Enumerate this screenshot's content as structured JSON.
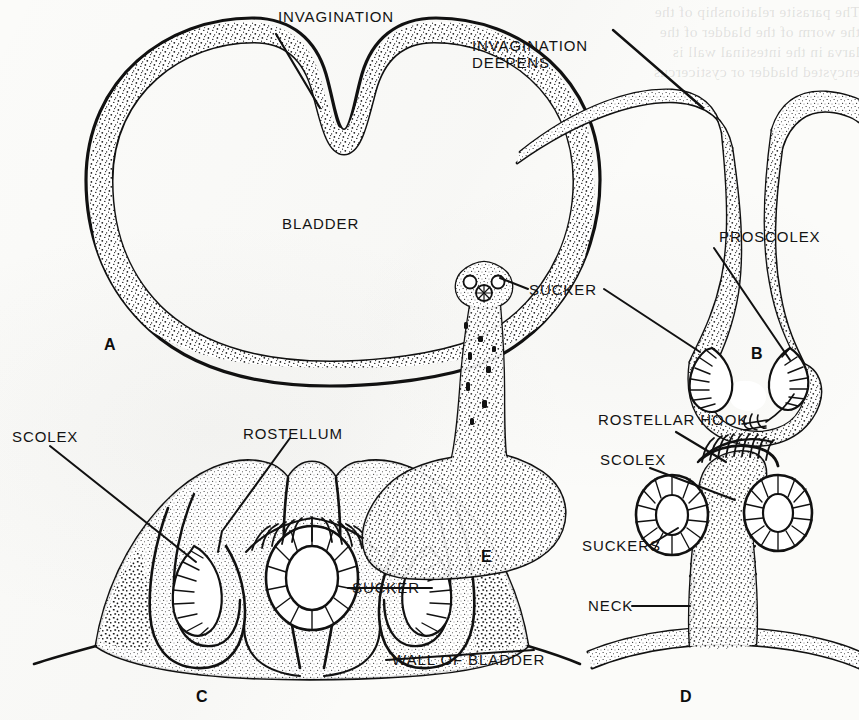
{
  "figure": {
    "background_color": "#fbfbf9",
    "ink_color": "#111111",
    "ghost_text": "The parasite relationship of the\nthe worm of the bladder of the\nlarva in the intestinal wall is\nencysted bladder or cysticercus"
  },
  "panels": [
    {
      "id": "A",
      "letter": "A",
      "name": "bladder-with-shallow-invagination"
    },
    {
      "id": "B",
      "letter": "B",
      "name": "invagination-deepens-proscolex"
    },
    {
      "id": "C",
      "letter": "C",
      "name": "invaginated-scolex-section"
    },
    {
      "id": "D",
      "letter": "D",
      "name": "everted-scolex-on-bladder-wall"
    },
    {
      "id": "E",
      "letter": "E",
      "name": "everted-scolex-whole-mount"
    }
  ],
  "labels": {
    "invagination": "INVAGINATION",
    "bladder": "BLADDER",
    "invagination_deepens": "INVAGINATION\nDEEPENS",
    "proscolex": "PROSCOLEX",
    "sucker_center": "SUCKER",
    "scolex_c": "SCOLEX",
    "rostellum": "ROSTELLUM",
    "sucker_c": "SUCKER",
    "wall_of_bladder": "WALL OF BLADDER",
    "rostellar_hook": "ROSTELLAR HOOK",
    "scolex_d": "SCOLEX",
    "suckers_d": "SUCKERS",
    "neck": "NECK"
  },
  "panel_letters": {
    "a": "A",
    "b": "B",
    "c": "C",
    "d": "D",
    "e": "E"
  }
}
